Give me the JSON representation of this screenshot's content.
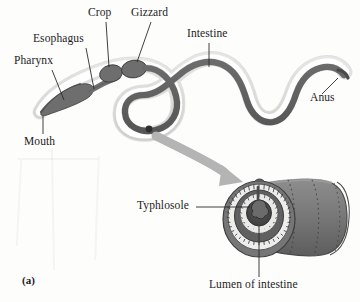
{
  "figure": {
    "panel_letter": "(a)",
    "background_color": "#fdfdfc",
    "ink_color": "#1c1c1c"
  },
  "colors": {
    "tract_dark": "#6e6e6e",
    "tract_dark_edge": "#3d3d3d",
    "body_wall": "#d9d9d6",
    "body_wall_edge": "#8a8a8a",
    "body_interior": "#ffffff",
    "arrow_gray": "#b4b4b4",
    "cylinder_body": "#7b7b7b",
    "cylinder_shadow": "#5f5f5f",
    "cylinder_highlight": "#9a9a9a",
    "lumen_dark": "#4a4a4a",
    "epithelium_ring": "#efefef",
    "leader_line": "#2a2a2a"
  },
  "labels": [
    {
      "id": "pharynx",
      "text": "Pharynx",
      "x": 14,
      "y": 62,
      "leader": "diagonal-down-right"
    },
    {
      "id": "esophagus",
      "text": "Esophagus",
      "x": 33,
      "y": 40,
      "leader": "vertical-down"
    },
    {
      "id": "crop",
      "text": "Crop",
      "x": 88,
      "y": 13,
      "leader": "vertical-down"
    },
    {
      "id": "gizzard",
      "text": "Gizzard",
      "x": 131,
      "y": 13,
      "leader": "diagonal-down-left"
    },
    {
      "id": "intestine",
      "text": "Intestine",
      "x": 190,
      "y": 35,
      "leader": "vertical-down"
    },
    {
      "id": "anus",
      "text": "Anus",
      "x": 307,
      "y": 98,
      "leader": "diagonal-up-left"
    },
    {
      "id": "mouth",
      "text": "Mouth",
      "x": 26,
      "y": 137,
      "leader": "vertical-up"
    },
    {
      "id": "typhlosole",
      "text": "Typhlosole",
      "x": 144,
      "y": 203,
      "leader": "horizontal-right"
    },
    {
      "id": "lumen",
      "text": "Lumen of intestine",
      "x": 244,
      "y": 283,
      "leader": "vertical-up"
    }
  ],
  "structures": {
    "mouth": "anterior pointed opening",
    "pharynx": "muscular bulb behind mouth",
    "esophagus": "narrow tube",
    "crop": "thin-walled storage sac",
    "gizzard": "muscular grinding chamber",
    "intestine": "long coiled absorptive tube",
    "anus": "posterior opening",
    "typhlosole": "dorsal infolding of intestinal wall",
    "lumen_of_intestine": "central cavity of the intestine"
  },
  "callout": {
    "arrow_from": "intestine segment",
    "arrow_to": "magnified cross-section cylinder",
    "description": "curved gray arrow indicating magnified view"
  }
}
